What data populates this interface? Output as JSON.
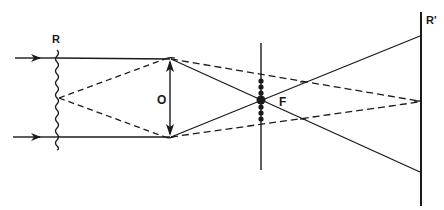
{
  "diagram": {
    "labels": {
      "reference": "R",
      "object": "O",
      "focus": "F",
      "screen": "R'"
    },
    "colors": {
      "ink": "#1a1a1a",
      "background": "#ffffff"
    },
    "elements": {
      "incoming_rays": 2,
      "wavefront": "wavy reference wavefront R",
      "lens": "object/lens O drawn as double-headed arrow",
      "focal_plane": "vertical line through focal point F with dots",
      "screen": "vertical screen R'"
    }
  }
}
